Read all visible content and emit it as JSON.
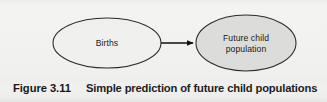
{
  "figure": {
    "caption_number": "Figure 3.11",
    "caption_text": "Simple prediction of future child populations",
    "background_color": "#f1f1ef",
    "ink_color": "#1a1a1a"
  },
  "diagram": {
    "type": "flow",
    "nodes": [
      {
        "id": "births",
        "shape": "ellipse",
        "label": "Births",
        "label_lines": [
          "Births"
        ],
        "fill_color": "#f0f0ee",
        "stroke_color": "#2a2a2a",
        "cx": 107,
        "cy": 43,
        "rx": 54,
        "ry": 25
      },
      {
        "id": "future-child-population",
        "shape": "ellipse",
        "label": "Future child population",
        "label_lines": [
          "Future child",
          "population"
        ],
        "fill_color": "#dcdcda",
        "stroke_color": "#2a2a2a",
        "cx": 246,
        "cy": 43,
        "rx": 50,
        "ry": 28
      }
    ],
    "edges": [
      {
        "id": "births-to-future-child-population",
        "from": "births",
        "to": "future-child-population",
        "style": "solid",
        "arrowhead": "filled-triangle",
        "stroke_color": "#111111",
        "x1": 161,
        "y1": 43,
        "x2": 196,
        "y2": 43
      }
    ]
  }
}
